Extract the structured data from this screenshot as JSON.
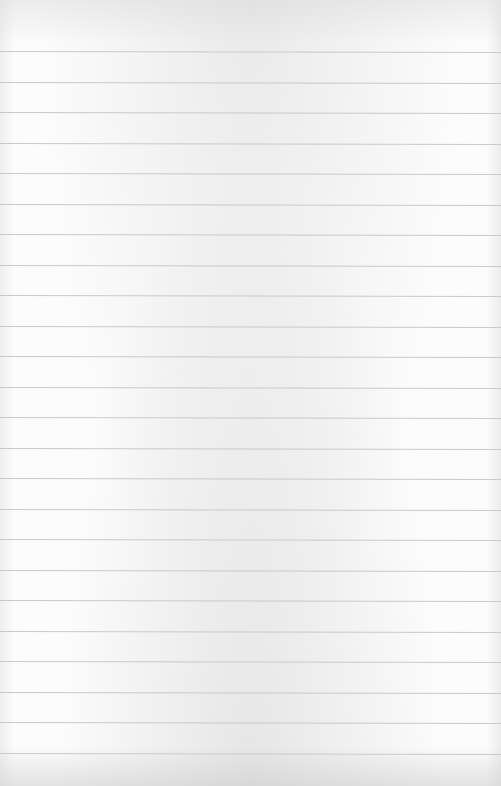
{
  "image": {
    "subject": "blank lined notebook paper",
    "text_content": "",
    "ruled_line_count": 24,
    "colors": {
      "paper": "#fcfcfc",
      "rule_line": "#c9c9c9"
    }
  }
}
